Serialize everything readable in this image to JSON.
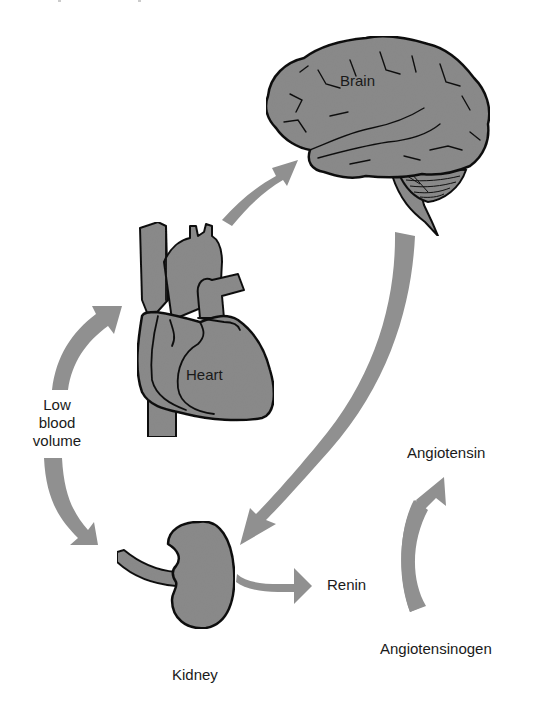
{
  "diagram": {
    "type": "physiological feedback loop",
    "colors": {
      "organ_fill": "#8a8a8a",
      "arrow_fill": "#909090",
      "outline": "#111111",
      "background": "#ffffff"
    },
    "nodes": {
      "brain": {
        "label": "Brain"
      },
      "heart": {
        "label": "Heart"
      },
      "kidney": {
        "label": "Kidney"
      },
      "renin": {
        "label": "Renin"
      },
      "angiotensin": {
        "label": "Angiotensin"
      },
      "angiotensinogen": {
        "label": "Angiotensinogen"
      },
      "low_blood_volume": {
        "lines": [
          "Low",
          "blood",
          "volume"
        ]
      }
    },
    "edges": [
      {
        "from": "low_blood_volume",
        "to": "heart",
        "name": "arrow-low-volume-to-heart"
      },
      {
        "from": "low_blood_volume",
        "to": "kidney",
        "name": "arrow-low-volume-to-kidney"
      },
      {
        "from": "heart",
        "to": "brain",
        "name": "arrow-heart-to-brain"
      },
      {
        "from": "brain",
        "to": "kidney",
        "name": "arrow-brain-to-kidney"
      },
      {
        "from": "kidney",
        "to": "renin",
        "name": "arrow-kidney-to-renin"
      },
      {
        "from": "angiotensinogen",
        "to": "angiotensin",
        "name": "arrow-angiotensinogen-to-angiotensin"
      }
    ]
  }
}
